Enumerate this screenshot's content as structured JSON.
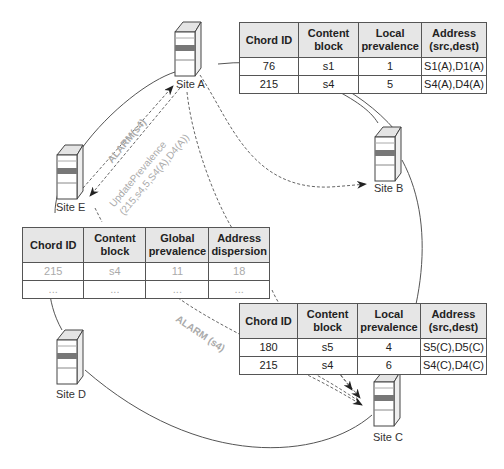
{
  "sites": {
    "a": {
      "label": "Site A"
    },
    "b": {
      "label": "Site B"
    },
    "c": {
      "label": "Site C"
    },
    "d": {
      "label": "Site D"
    },
    "e": {
      "label": "Site E"
    }
  },
  "site_a_table": {
    "headers": [
      "Chord ID",
      "Content block",
      "Local prevalence",
      "Address (src,dest)"
    ],
    "rows": [
      [
        "76",
        "s1",
        "1",
        "S1(A),D1(A)"
      ],
      [
        "215",
        "s4",
        "5",
        "S4(A),D4(A)"
      ]
    ]
  },
  "site_c_table": {
    "headers": [
      "Chord ID",
      "Content block",
      "Local prevalence",
      "Address (src,dest)"
    ],
    "rows": [
      [
        "180",
        "s5",
        "4",
        "S5(C),D5(C)"
      ],
      [
        "215",
        "s4",
        "6",
        "S4(C),D4(C)"
      ]
    ]
  },
  "global_table": {
    "headers": [
      "Chord ID",
      "Content block",
      "Global prevalence",
      "Address dispersion"
    ],
    "rows": [
      [
        "215",
        "s4",
        "11",
        "18"
      ],
      [
        "...",
        "...",
        "...",
        "..."
      ]
    ]
  },
  "messages": {
    "alarm_e_to_a": "ALARM(s4)",
    "update_line1": "UpdatePrevalence",
    "update_line2": "(215,s4,5,S4(A),D4(A))",
    "alarm_to_c": "ALARM (s4)"
  },
  "colors": {
    "header_bg": "#e6e6e6",
    "line": "#555555",
    "dashed": "#666666",
    "muted_text": "#aaaaaa"
  }
}
